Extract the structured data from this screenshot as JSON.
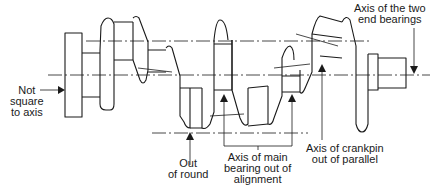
{
  "figure": {
    "labels": {
      "not_square": [
        "Not",
        "square",
        "to axis"
      ],
      "out_of_round": [
        "Out",
        "of round"
      ],
      "main_bearing": [
        "Axis of main",
        "bearing out of",
        "alignment"
      ],
      "crankpin": [
        "Axis of crankpin",
        "out of parallel"
      ],
      "end_bearings": [
        "Axis of the two",
        "end bearings"
      ]
    }
  }
}
